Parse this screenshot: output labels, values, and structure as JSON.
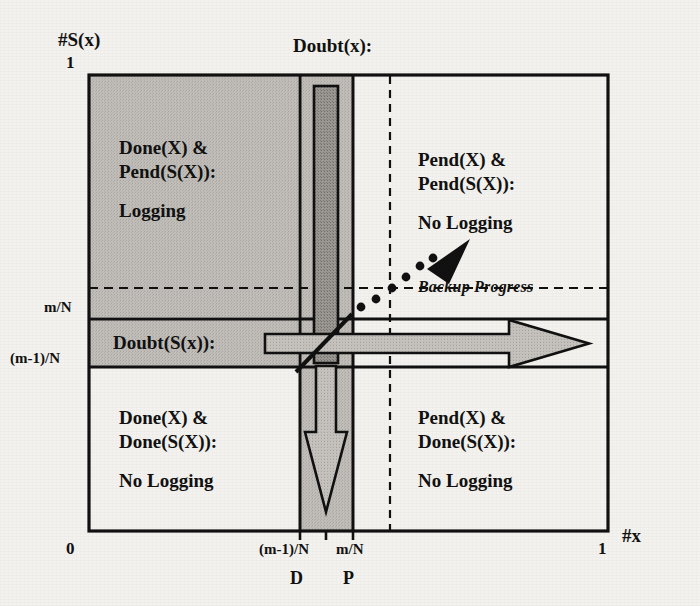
{
  "figure": {
    "type": "diagram",
    "subtype": "state-space-quadrant-diagram",
    "y_axis_title": "#S(x)",
    "x_axis_title": "#x",
    "y_ticks": [
      {
        "value": 1.0,
        "label": "1"
      },
      {
        "value": 0.62,
        "label": "m/N"
      },
      {
        "value": 0.49,
        "label": "(m-1)/N"
      }
    ],
    "x_ticks": [
      {
        "value": 0.0,
        "label": "0"
      },
      {
        "value": 0.4,
        "label": "(m-1)/N"
      },
      {
        "value": 0.5,
        "label": "m/N"
      },
      {
        "value": 1.0,
        "label": "1"
      }
    ],
    "column_markers": [
      {
        "label": "D"
      },
      {
        "label": "P"
      }
    ],
    "column_label": "Doubt(x):",
    "band_label": "Doubt(S(x)):",
    "progress_label": "Backup Progress",
    "quadrants": [
      {
        "id": "top-left",
        "line1": "Done(X) &",
        "line2": "Pend(S(X)):",
        "line3": "Logging"
      },
      {
        "id": "top-right",
        "line1": "Pend(X) &",
        "line2": "Pend(S(X)):",
        "line3": "No Logging"
      },
      {
        "id": "bottom-left",
        "line1": "Done(X) &",
        "line2": "Done(S(X)):",
        "line3": "No Logging"
      },
      {
        "id": "bottom-right",
        "line1": "Pend(X) &",
        "line2": "Done(S(X)):",
        "line3": "No Logging"
      }
    ],
    "colors": {
      "ink": "#111111",
      "paper": "#f4f2ee",
      "shade_light": "#b9b6b1",
      "shade_mid": "#c3c0bb",
      "shade_dark": "#8f8c88",
      "arrow_fill": "#b5b2ad"
    },
    "icons": {
      "progress_arrowhead": "triangle-up-right-icon",
      "down_arrow": "arrow-down-icon",
      "right_arrow": "arrow-right-icon",
      "dotted_trail": "dotted-line-icon"
    }
  }
}
